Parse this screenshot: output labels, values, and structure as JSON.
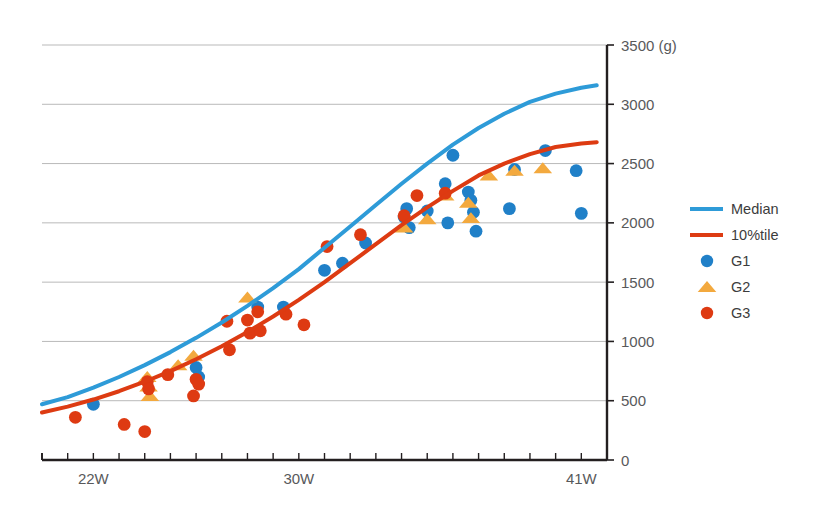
{
  "chart_data": {
    "type": "scatter",
    "title": "",
    "subtitle": "",
    "xlabel": "",
    "ylabel": "",
    "unit_label": "(g)",
    "grid": true,
    "legend_position": "right",
    "xlim": [
      20,
      42
    ],
    "ylim": [
      0,
      3500
    ],
    "x_tick_labels": [
      "22W",
      "30W",
      "41W"
    ],
    "x_tick_values": [
      22,
      30,
      41
    ],
    "x_minor_ticks": [
      20,
      21,
      22,
      23,
      24,
      25,
      26,
      27,
      28,
      29,
      30,
      31,
      32,
      33,
      34,
      35,
      36,
      37,
      38,
      39,
      40,
      41,
      42
    ],
    "y_tick_labels": [
      "0",
      "500",
      "1000",
      "1500",
      "2000",
      "2500",
      "3000",
      "3500 (g)"
    ],
    "y_tick_values": [
      0,
      500,
      1000,
      1500,
      2000,
      2500,
      3000,
      3500
    ],
    "series": [
      {
        "name": "Median",
        "type": "line",
        "color": "#2e9bd8",
        "points": [
          [
            20.0,
            470
          ],
          [
            21.0,
            530
          ],
          [
            22.0,
            610
          ],
          [
            23.0,
            700
          ],
          [
            24.0,
            800
          ],
          [
            25.0,
            910
          ],
          [
            26.0,
            1030
          ],
          [
            27.0,
            1160
          ],
          [
            28.0,
            1300
          ],
          [
            29.0,
            1450
          ],
          [
            30.0,
            1610
          ],
          [
            31.0,
            1790
          ],
          [
            32.0,
            1970
          ],
          [
            33.0,
            2150
          ],
          [
            34.0,
            2330
          ],
          [
            35.0,
            2500
          ],
          [
            36.0,
            2660
          ],
          [
            37.0,
            2800
          ],
          [
            38.0,
            2920
          ],
          [
            39.0,
            3020
          ],
          [
            40.0,
            3090
          ],
          [
            41.0,
            3140
          ],
          [
            41.6,
            3160
          ]
        ]
      },
      {
        "name": "10%tile",
        "type": "line",
        "color": "#dd3b12",
        "points": [
          [
            20.0,
            400
          ],
          [
            21.0,
            450
          ],
          [
            22.0,
            510
          ],
          [
            23.0,
            580
          ],
          [
            24.0,
            660
          ],
          [
            25.0,
            750
          ],
          [
            26.0,
            850
          ],
          [
            27.0,
            960
          ],
          [
            28.0,
            1080
          ],
          [
            29.0,
            1210
          ],
          [
            30.0,
            1350
          ],
          [
            31.0,
            1500
          ],
          [
            32.0,
            1660
          ],
          [
            33.0,
            1820
          ],
          [
            34.0,
            1980
          ],
          [
            35.0,
            2130
          ],
          [
            36.0,
            2270
          ],
          [
            37.0,
            2400
          ],
          [
            38.0,
            2500
          ],
          [
            39.0,
            2580
          ],
          [
            40.0,
            2640
          ],
          [
            41.0,
            2670
          ],
          [
            41.6,
            2680
          ]
        ]
      },
      {
        "name": "G1",
        "type": "scatter",
        "marker": "circle",
        "color": "#2080c8",
        "points": [
          [
            22.0,
            470
          ],
          [
            26.0,
            780
          ],
          [
            26.1,
            700
          ],
          [
            28.4,
            1290
          ],
          [
            29.4,
            1290
          ],
          [
            31.0,
            1600
          ],
          [
            31.7,
            1660
          ],
          [
            32.6,
            1830
          ],
          [
            34.1,
            2050
          ],
          [
            34.2,
            2120
          ],
          [
            34.3,
            1960
          ],
          [
            35.0,
            2100
          ],
          [
            35.7,
            2330
          ],
          [
            35.8,
            2000
          ],
          [
            36.0,
            2570
          ],
          [
            36.6,
            2260
          ],
          [
            36.7,
            2190
          ],
          [
            36.8,
            2090
          ],
          [
            36.9,
            1930
          ],
          [
            38.2,
            2120
          ],
          [
            38.4,
            2450
          ],
          [
            39.6,
            2610
          ],
          [
            40.8,
            2440
          ],
          [
            41.0,
            2080
          ]
        ]
      },
      {
        "name": "G2",
        "type": "scatter",
        "marker": "triangle",
        "color": "#f3a93e",
        "points": [
          [
            24.1,
            700
          ],
          [
            24.15,
            620
          ],
          [
            24.2,
            540
          ],
          [
            25.3,
            800
          ],
          [
            25.9,
            880
          ],
          [
            28.0,
            1370
          ],
          [
            34.1,
            1960
          ],
          [
            35.0,
            2030
          ],
          [
            35.7,
            2230
          ],
          [
            36.6,
            2170
          ],
          [
            36.7,
            2040
          ],
          [
            37.4,
            2400
          ],
          [
            38.4,
            2440
          ],
          [
            39.5,
            2460
          ]
        ]
      },
      {
        "name": "G3",
        "type": "scatter",
        "marker": "circle",
        "color": "#de3a12",
        "points": [
          [
            21.3,
            360
          ],
          [
            23.2,
            300
          ],
          [
            24.0,
            240
          ],
          [
            24.1,
            660
          ],
          [
            24.15,
            600
          ],
          [
            24.9,
            720
          ],
          [
            25.9,
            540
          ],
          [
            26.0,
            680
          ],
          [
            26.1,
            640
          ],
          [
            27.2,
            1170
          ],
          [
            27.3,
            930
          ],
          [
            28.0,
            1180
          ],
          [
            28.1,
            1070
          ],
          [
            28.4,
            1250
          ],
          [
            28.5,
            1090
          ],
          [
            29.5,
            1230
          ],
          [
            30.2,
            1140
          ],
          [
            31.1,
            1800
          ],
          [
            32.4,
            1900
          ],
          [
            34.1,
            2060
          ],
          [
            34.6,
            2230
          ],
          [
            35.7,
            2250
          ]
        ]
      }
    ]
  },
  "legend": {
    "items": [
      {
        "label": "Median",
        "kind": "line",
        "color": "#2e9bd8"
      },
      {
        "label": "10%tile",
        "kind": "line",
        "color": "#dd3b12"
      },
      {
        "label": "G1",
        "kind": "circle",
        "color": "#2080c8"
      },
      {
        "label": "G2",
        "kind": "triangle",
        "color": "#f3a93e"
      },
      {
        "label": "G3",
        "kind": "circle",
        "color": "#de3a12"
      }
    ]
  },
  "axes": {
    "y_axis_color": "#231f20",
    "x_axis_color": "#231f20",
    "grid_color": "#b9b9b9"
  }
}
